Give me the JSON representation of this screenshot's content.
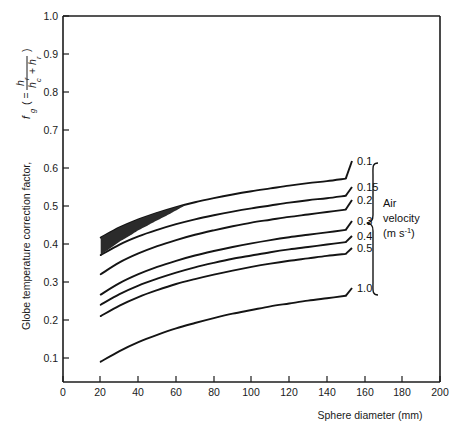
{
  "chart_data": {
    "type": "line",
    "title": "",
    "xlabel": "Sphere diameter (mm)",
    "ylabel": "Globe temperature correction factor, f_g ( = h_r / (h_c + h_r) )",
    "ylabel_parts": {
      "main": "Globe temperature correction factor,",
      "symbol": "f",
      "symbol_sub": "g",
      "paren_open": "( =",
      "numerator": "h",
      "numerator_sub": "r",
      "denominator_a": "h",
      "denominator_a_sub": "c",
      "denominator_plus": "+",
      "denominator_b": "h",
      "denominator_b_sub": "r",
      "paren_close": ")"
    },
    "xlim": [
      0,
      200
    ],
    "ylim": [
      0.1,
      1.0
    ],
    "xticks": [
      0,
      20,
      40,
      60,
      80,
      100,
      120,
      140,
      160,
      180,
      200
    ],
    "xticklabels": [
      "0",
      "20",
      "40",
      "60",
      "80",
      "100",
      "120",
      "140",
      "160",
      "180",
      "200"
    ],
    "yticks": [
      0.1,
      0.2,
      0.3,
      0.4,
      0.5,
      0.6,
      0.7,
      0.8,
      0.9,
      1.0
    ],
    "yticklabels": [
      "0.1",
      "0.2",
      "0.3",
      "0.4",
      "0.5",
      "0.6",
      "0.7",
      "0.8",
      "0.9",
      "1.0"
    ],
    "grid": false,
    "legend_position": "right-outside",
    "legend_title_line1": "Air",
    "legend_title_line2": "velocity",
    "legend_title_line3_a": "(m s",
    "legend_title_line3_sup": "-1",
    "legend_title_line3_b": ")",
    "series": [
      {
        "name": "0.1",
        "label": "0.1",
        "x": [
          20,
          30,
          40,
          50,
          60,
          70,
          80,
          90,
          100,
          110,
          120,
          130,
          140,
          150
        ],
        "values": [
          0.455,
          0.48,
          0.5,
          0.516,
          0.53,
          0.542,
          0.552,
          0.561,
          0.569,
          0.576,
          0.583,
          0.589,
          0.594,
          0.6
        ]
      },
      {
        "name": "0.15",
        "label": "0.15",
        "x": [
          20,
          30,
          40,
          50,
          60,
          70,
          80,
          90,
          100,
          110,
          120,
          130,
          140,
          150
        ],
        "values": [
          0.412,
          0.438,
          0.458,
          0.474,
          0.488,
          0.5,
          0.51,
          0.519,
          0.527,
          0.534,
          0.541,
          0.547,
          0.552,
          0.558
        ]
      },
      {
        "name": "0.2",
        "label": "0.2",
        "x": [
          20,
          30,
          40,
          50,
          60,
          70,
          80,
          90,
          100,
          110,
          120,
          130,
          140,
          150
        ],
        "values": [
          0.365,
          0.394,
          0.416,
          0.434,
          0.449,
          0.462,
          0.473,
          0.483,
          0.492,
          0.499,
          0.506,
          0.512,
          0.518,
          0.524
        ]
      },
      {
        "name": "0.3",
        "label": "0.3",
        "x": [
          20,
          30,
          40,
          50,
          60,
          70,
          80,
          90,
          100,
          110,
          120,
          130,
          140,
          150
        ],
        "values": [
          0.315,
          0.343,
          0.365,
          0.383,
          0.398,
          0.411,
          0.422,
          0.432,
          0.441,
          0.449,
          0.456,
          0.462,
          0.468,
          0.474
        ]
      },
      {
        "name": "0.4",
        "label": "0.4",
        "x": [
          20,
          30,
          40,
          50,
          60,
          70,
          80,
          90,
          100,
          110,
          120,
          130,
          140,
          150
        ],
        "values": [
          0.29,
          0.316,
          0.337,
          0.354,
          0.369,
          0.382,
          0.393,
          0.403,
          0.411,
          0.419,
          0.426,
          0.432,
          0.438,
          0.444
        ]
      },
      {
        "name": "0.5",
        "label": "0.5",
        "x": [
          20,
          30,
          40,
          50,
          60,
          70,
          80,
          90,
          100,
          110,
          120,
          130,
          140,
          150
        ],
        "values": [
          0.262,
          0.288,
          0.309,
          0.326,
          0.341,
          0.353,
          0.364,
          0.374,
          0.383,
          0.391,
          0.398,
          0.404,
          0.41,
          0.415
        ]
      },
      {
        "name": "1.0",
        "label": "1.0",
        "x": [
          20,
          30,
          40,
          50,
          60,
          70,
          80,
          90,
          100,
          110,
          120,
          130,
          140,
          150
        ],
        "values": [
          0.15,
          0.176,
          0.198,
          0.216,
          0.232,
          0.245,
          0.257,
          0.268,
          0.277,
          0.286,
          0.293,
          0.3,
          0.306,
          0.312
        ]
      }
    ],
    "annotations": [
      {
        "name": "shaded-region",
        "description": "Dark shaded lens between the 0.1 and 0.15 curves",
        "x_range": [
          20,
          65
        ],
        "upper_series": "0.1",
        "lower_series": "0.15"
      }
    ]
  }
}
